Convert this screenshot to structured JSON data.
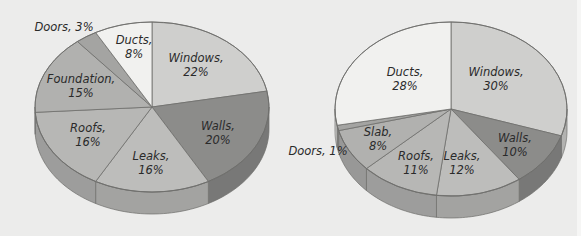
{
  "chart_data": [
    {
      "type": "pie",
      "style": "3d",
      "title": "",
      "categories": [
        "Windows",
        "Walls",
        "Leaks",
        "Roofs",
        "Foundation",
        "Doors",
        "Ducts"
      ],
      "values": [
        22,
        20,
        16,
        16,
        15,
        3,
        8
      ],
      "labels": [
        "Windows, 22%",
        "Walls, 20%",
        "Leaks, 16%",
        "Roofs, 16%",
        "Foundation, 15%",
        "Doors, 3%",
        "Ducts, 8%"
      ],
      "colors": [
        "#cfcfcd",
        "#8c8c8a",
        "#bdbdbb",
        "#b7b7b5",
        "#b1b1af",
        "#a4a4a2",
        "#f1f1ef"
      ],
      "legend": "none",
      "geometry": {
        "cx": 152,
        "cy": 107,
        "rx": 117,
        "ry": 85,
        "depth": 22
      },
      "label_positions": [
        {
          "x": 196,
          "y": 62,
          "lines": [
            "Windows,",
            "22%"
          ]
        },
        {
          "x": 218,
          "y": 130,
          "lines": [
            "Walls,",
            "20%"
          ]
        },
        {
          "x": 151,
          "y": 160,
          "lines": [
            "Leaks,",
            "16%"
          ]
        },
        {
          "x": 88,
          "y": 132,
          "lines": [
            "Roofs,",
            "16%"
          ]
        },
        {
          "x": 81,
          "y": 83,
          "lines": [
            "Foundation,",
            "15%"
          ]
        },
        {
          "x": 64,
          "y": 31,
          "lines": [
            "Doors, 3%"
          ],
          "outside": true
        },
        {
          "x": 134,
          "y": 44,
          "lines": [
            "Ducts,",
            "8%"
          ]
        }
      ]
    },
    {
      "type": "pie",
      "style": "3d",
      "title": "",
      "categories": [
        "Windows",
        "Walls",
        "Leaks",
        "Roofs",
        "Slab",
        "Doors",
        "Ducts"
      ],
      "values": [
        30,
        10,
        12,
        11,
        8,
        1,
        28
      ],
      "labels": [
        "Windows, 30%",
        "Walls, 10%",
        "Leaks, 12%",
        "Roofs, 11%",
        "Slab, 8%",
        "Doors, 1%",
        "Ducts, 28%"
      ],
      "colors": [
        "#cfcfcd",
        "#8c8c8a",
        "#bdbdbb",
        "#b7b7b5",
        "#b1b1af",
        "#a4a4a2",
        "#f1f1ef"
      ],
      "legend": "none",
      "geometry": {
        "cx": 451,
        "cy": 109,
        "rx": 116,
        "ry": 87,
        "depth": 22
      },
      "label_positions": [
        {
          "x": 496,
          "y": 76,
          "lines": [
            "Windows,",
            "30%"
          ]
        },
        {
          "x": 515,
          "y": 142,
          "lines": [
            "Walls,",
            "10%"
          ]
        },
        {
          "x": 462,
          "y": 160,
          "lines": [
            "Leaks,",
            "12%"
          ]
        },
        {
          "x": 416,
          "y": 160,
          "lines": [
            "Roofs,",
            "11%"
          ]
        },
        {
          "x": 378,
          "y": 136,
          "lines": [
            "Slab,",
            "8%"
          ]
        },
        {
          "x": 318,
          "y": 155,
          "lines": [
            "Doors, 1%"
          ],
          "outside": true
        },
        {
          "x": 405,
          "y": 76,
          "lines": [
            "Ducts,",
            "28%"
          ]
        }
      ]
    }
  ]
}
